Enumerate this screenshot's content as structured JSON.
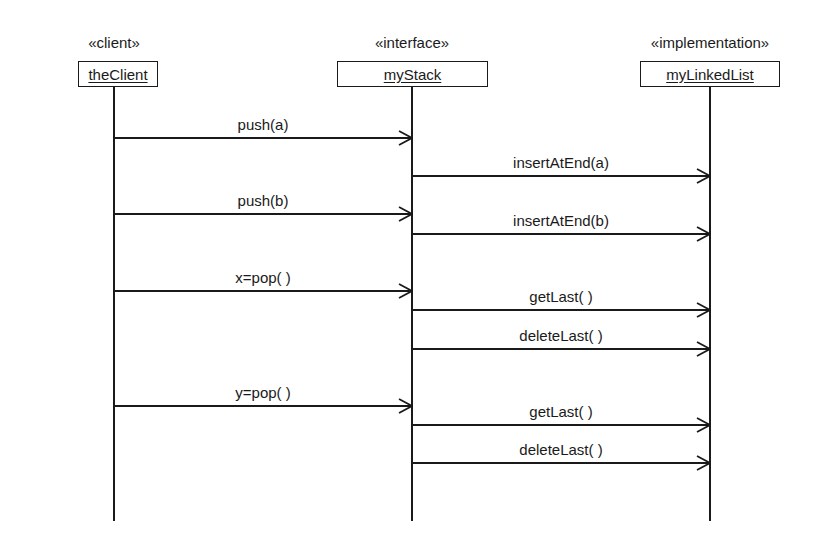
{
  "diagram": {
    "type": "UML sequence diagram",
    "participants": [
      {
        "stereotype": "«client»",
        "name": "theClient",
        "x": 114,
        "box_left": 78,
        "box_width": 80
      },
      {
        "stereotype": "«interface»",
        "name": "myStack",
        "x": 412,
        "box_left": 337,
        "box_width": 151
      },
      {
        "stereotype": "«implementation»",
        "name": "myLinkedList",
        "x": 710,
        "box_left": 640,
        "box_width": 140
      }
    ],
    "messages": [
      {
        "label": "push(a)",
        "from": "theClient",
        "to": "myStack",
        "y": 138
      },
      {
        "label": "insertAtEnd(a)",
        "from": "myStack",
        "to": "myLinkedList",
        "y": 176
      },
      {
        "label": "push(b)",
        "from": "theClient",
        "to": "myStack",
        "y": 214
      },
      {
        "label": "insertAtEnd(b)",
        "from": "myStack",
        "to": "myLinkedList",
        "y": 234
      },
      {
        "label": "x=pop( )",
        "from": "theClient",
        "to": "myStack",
        "y": 291
      },
      {
        "label": "getLast( )",
        "from": "myStack",
        "to": "myLinkedList",
        "y": 310
      },
      {
        "label": "deleteLast( )",
        "from": "myStack",
        "to": "myLinkedList",
        "y": 349
      },
      {
        "label": "y=pop( )",
        "from": "theClient",
        "to": "myStack",
        "y": 406
      },
      {
        "label": "getLast( )",
        "from": "myStack",
        "to": "myLinkedList",
        "y": 425
      },
      {
        "label": "deleteLast( )",
        "from": "myStack",
        "to": "myLinkedList",
        "y": 463
      }
    ]
  }
}
